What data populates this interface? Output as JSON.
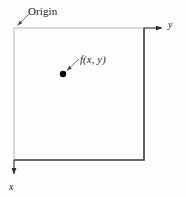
{
  "figure": {
    "background_color": "#fefefe",
    "labels": {
      "origin": "Origin",
      "point": "f(x, y)",
      "axis_y": "y",
      "axis_x": "x"
    },
    "colors": {
      "thin_line": "#b4b4b4",
      "thick_line": "#3a3a3a",
      "leader_line": "#6b6b6b",
      "point_fill": "#000000",
      "text": "#1a1a1a"
    },
    "geometry": {
      "origin_x": 14,
      "origin_y": 28,
      "frame_right_x": 144,
      "frame_bottom_y": 160,
      "y_axis_arrow_tip_x": 166,
      "x_axis_arrow_tip_y": 178,
      "point_x": 63,
      "point_y": 74,
      "point_radius": 3.2,
      "leader_origin_start_x": 30,
      "leader_origin_start_y": 14,
      "leader_point_start_x": 78,
      "leader_point_start_y": 59
    }
  }
}
